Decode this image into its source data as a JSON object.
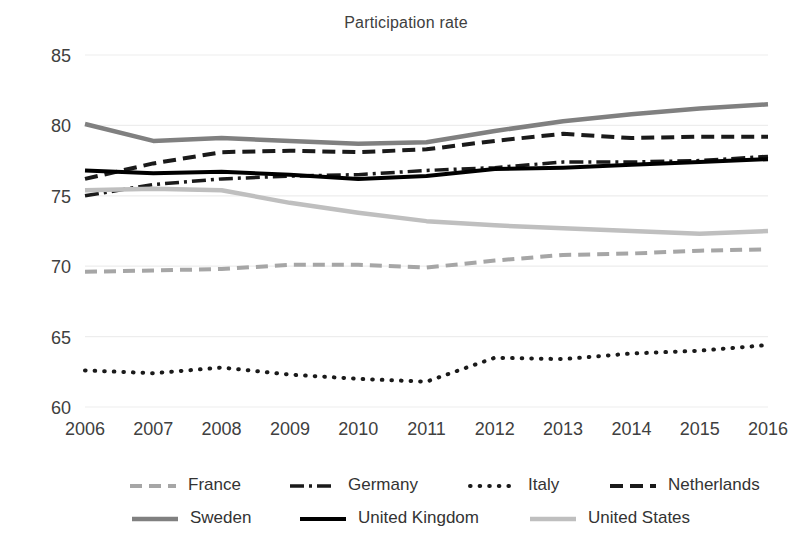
{
  "chart_data": {
    "type": "line",
    "title": "Participation rate",
    "xlabel": "",
    "ylabel": "",
    "x": [
      2006,
      2007,
      2008,
      2009,
      2010,
      2011,
      2012,
      2013,
      2014,
      2015,
      2016
    ],
    "categories": [
      "2006",
      "2007",
      "2008",
      "2009",
      "2010",
      "2011",
      "2012",
      "2013",
      "2014",
      "2015",
      "2016"
    ],
    "xlim": [
      2006,
      2016
    ],
    "ylim": [
      60,
      85
    ],
    "yticks": [
      60,
      65,
      70,
      75,
      80,
      85
    ],
    "ytick_labels": [
      "60",
      "65",
      "70",
      "75",
      "80",
      "85"
    ],
    "grid": true,
    "grid_axis": "y",
    "legend_position": "bottom",
    "series": [
      {
        "name": "France",
        "color": "#A6A6A6",
        "style": "dashed",
        "width": 4,
        "dash": "12,7",
        "values": [
          69.6,
          69.7,
          69.8,
          70.1,
          70.1,
          69.9,
          70.4,
          70.8,
          70.9,
          71.1,
          71.2
        ]
      },
      {
        "name": "Germany",
        "color": "#1A1A1A",
        "style": "dash-dot",
        "width": 3.5,
        "dash": "14,5,3,5",
        "values": [
          75.0,
          75.8,
          76.2,
          76.4,
          76.5,
          76.8,
          77.0,
          77.4,
          77.4,
          77.5,
          77.8
        ]
      },
      {
        "name": "Italy",
        "color": "#1A1A1A",
        "style": "dotted",
        "width": 4,
        "dash": "0.6,9",
        "values": [
          62.6,
          62.4,
          62.8,
          62.3,
          62.0,
          61.8,
          63.5,
          63.4,
          63.8,
          64.0,
          64.4
        ]
      },
      {
        "name": "Netherlands",
        "color": "#1A1A1A",
        "style": "dashed",
        "width": 4,
        "dash": "13,7",
        "values": [
          76.2,
          77.3,
          78.1,
          78.2,
          78.1,
          78.3,
          78.9,
          79.4,
          79.1,
          79.2,
          79.2
        ]
      },
      {
        "name": "Sweden",
        "color": "#808080",
        "style": "solid",
        "width": 4.5,
        "dash": "",
        "values": [
          80.1,
          78.9,
          79.1,
          78.9,
          78.7,
          78.8,
          79.6,
          80.3,
          80.8,
          81.2,
          81.5
        ]
      },
      {
        "name": "United Kingdom",
        "color": "#000000",
        "style": "solid",
        "width": 4,
        "dash": "",
        "values": [
          76.8,
          76.6,
          76.7,
          76.5,
          76.2,
          76.4,
          76.9,
          77.0,
          77.2,
          77.4,
          77.6
        ]
      },
      {
        "name": "United States",
        "color": "#BFBFBF",
        "style": "solid",
        "width": 4.5,
        "dash": "",
        "values": [
          75.4,
          75.5,
          75.4,
          74.5,
          73.8,
          73.2,
          72.9,
          72.7,
          72.5,
          72.3,
          72.5
        ]
      }
    ]
  }
}
